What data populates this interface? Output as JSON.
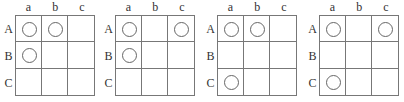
{
  "column_labels": [
    "a",
    "b",
    "c"
  ],
  "row_labels": [
    "A",
    "B",
    "C"
  ],
  "panels": [
    {
      "id": 1,
      "cells": [
        [
          true,
          true,
          false
        ],
        [
          true,
          false,
          false
        ],
        [
          false,
          false,
          false
        ]
      ]
    },
    {
      "id": 2,
      "cells": [
        [
          true,
          false,
          true
        ],
        [
          true,
          false,
          false
        ],
        [
          false,
          false,
          false
        ]
      ]
    },
    {
      "id": 3,
      "cells": [
        [
          true,
          true,
          false
        ],
        [
          false,
          false,
          false
        ],
        [
          true,
          false,
          false
        ]
      ]
    },
    {
      "id": 4,
      "cells": [
        [
          true,
          false,
          true
        ],
        [
          false,
          false,
          false
        ],
        [
          true,
          false,
          false
        ]
      ]
    }
  ]
}
